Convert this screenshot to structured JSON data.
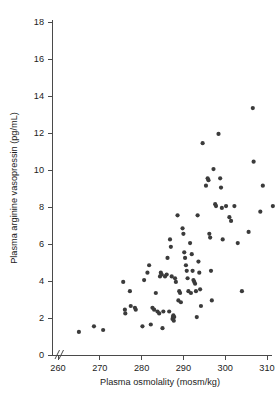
{
  "chart_data": {
    "type": "scatter",
    "title": "",
    "xlabel": "Plasma osmolality (mosm/kg)",
    "ylabel": "Plasma arginine vasopressin (pg/mL)",
    "xlim": [
      258,
      317
    ],
    "ylim": [
      0,
      18
    ],
    "xticks": [
      260,
      270,
      280,
      290,
      300,
      310
    ],
    "yticks": [
      0,
      2,
      4,
      6,
      8,
      10,
      12,
      14,
      16,
      18
    ],
    "xtick_labels": [
      "260",
      "270",
      "280",
      "290",
      "300",
      "310"
    ],
    "ytick_labels": [
      "0",
      "2",
      "4",
      "6",
      "8",
      "10",
      "12",
      "14",
      "16",
      "18"
    ],
    "grid": false,
    "legend": null,
    "axis_break": "//",
    "marker": {
      "shape": "circle",
      "color": "#3b3b3b",
      "size": 4.2
    },
    "points": [
      [
        265.0,
        1.25
      ],
      [
        268.6,
        1.55
      ],
      [
        270.8,
        1.35
      ],
      [
        275.6,
        3.95
      ],
      [
        276.0,
        2.45
      ],
      [
        276.1,
        2.25
      ],
      [
        277.2,
        3.45
      ],
      [
        277.4,
        2.65
      ],
      [
        278.4,
        2.55
      ],
      [
        278.6,
        2.45
      ],
      [
        280.2,
        1.55
      ],
      [
        280.6,
        4.05
      ],
      [
        281.4,
        4.45
      ],
      [
        281.8,
        4.85
      ],
      [
        282.2,
        1.65
      ],
      [
        282.6,
        2.55
      ],
      [
        283.0,
        2.45
      ],
      [
        283.4,
        3.35
      ],
      [
        283.8,
        2.35
      ],
      [
        284.2,
        2.25
      ],
      [
        284.4,
        4.25
      ],
      [
        284.6,
        4.45
      ],
      [
        284.8,
        4.35
      ],
      [
        285.0,
        1.45
      ],
      [
        285.2,
        2.35
      ],
      [
        285.6,
        4.25
      ],
      [
        286.0,
        4.35
      ],
      [
        286.2,
        5.25
      ],
      [
        286.6,
        2.35
      ],
      [
        286.8,
        6.25
      ],
      [
        287.0,
        5.85
      ],
      [
        287.2,
        4.25
      ],
      [
        287.4,
        1.95
      ],
      [
        287.5,
        2.05
      ],
      [
        287.6,
        2.15
      ],
      [
        287.7,
        1.85
      ],
      [
        287.8,
        2.05
      ],
      [
        288.0,
        4.15
      ],
      [
        288.2,
        3.95
      ],
      [
        288.6,
        7.55
      ],
      [
        288.8,
        2.95
      ],
      [
        289.0,
        3.45
      ],
      [
        289.2,
        3.35
      ],
      [
        289.4,
        2.85
      ],
      [
        289.8,
        6.85
      ],
      [
        290.0,
        6.55
      ],
      [
        290.2,
        5.55
      ],
      [
        290.4,
        5.25
      ],
      [
        290.6,
        4.85
      ],
      [
        290.8,
        4.55
      ],
      [
        291.0,
        4.15
      ],
      [
        291.2,
        3.45
      ],
      [
        291.6,
        6.05
      ],
      [
        291.8,
        3.35
      ],
      [
        292.0,
        5.45
      ],
      [
        292.2,
        4.55
      ],
      [
        292.4,
        4.05
      ],
      [
        292.6,
        3.95
      ],
      [
        292.8,
        3.85
      ],
      [
        293.0,
        3.45
      ],
      [
        293.2,
        2.05
      ],
      [
        293.4,
        7.55
      ],
      [
        293.6,
        5.05
      ],
      [
        293.8,
        4.45
      ],
      [
        294.0,
        3.55
      ],
      [
        294.2,
        2.65
      ],
      [
        294.6,
        11.45
      ],
      [
        295.4,
        9.15
      ],
      [
        295.8,
        9.55
      ],
      [
        296.0,
        9.45
      ],
      [
        296.2,
        6.55
      ],
      [
        296.4,
        6.35
      ],
      [
        296.6,
        4.55
      ],
      [
        296.8,
        2.95
      ],
      [
        297.2,
        10.05
      ],
      [
        297.6,
        8.15
      ],
      [
        297.8,
        8.05
      ],
      [
        298.4,
        11.95
      ],
      [
        298.8,
        9.55
      ],
      [
        299.0,
        9.05
      ],
      [
        299.2,
        7.95
      ],
      [
        299.4,
        6.25
      ],
      [
        300.2,
        8.05
      ],
      [
        301.0,
        7.45
      ],
      [
        301.4,
        7.25
      ],
      [
        302.2,
        8.05
      ],
      [
        303.0,
        6.05
      ],
      [
        304.0,
        3.45
      ],
      [
        305.6,
        6.65
      ],
      [
        306.6,
        13.35
      ],
      [
        306.8,
        10.45
      ],
      [
        308.4,
        7.75
      ],
      [
        309.0,
        9.15
      ],
      [
        311.4,
        8.05
      ],
      [
        314.8,
        17.15
      ]
    ]
  }
}
